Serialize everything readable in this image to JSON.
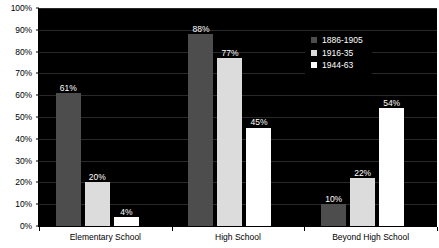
{
  "chart_data": {
    "type": "bar",
    "title": "",
    "xlabel": "",
    "ylabel": "",
    "categories": [
      "Elementary School",
      "High School",
      "Beyond High School"
    ],
    "series": [
      {
        "name": "1886-1905",
        "color": "#4d4d4d",
        "values": [
          61,
          88,
          10
        ],
        "labels": [
          "61%",
          "88%",
          "10%"
        ]
      },
      {
        "name": "1916-35",
        "color": "#dcdcdc",
        "values": [
          20,
          77,
          22
        ],
        "labels": [
          "20%",
          "77%",
          "22%"
        ]
      },
      {
        "name": "1944-63",
        "color": "#ffffff",
        "values": [
          4,
          45,
          54
        ],
        "labels": [
          "4%",
          "45%",
          "54%"
        ]
      }
    ],
    "ylim": [
      0,
      100
    ],
    "ytick_labels": [
      "100%",
      "90%",
      "80%",
      "70%",
      "60%",
      "50%",
      "40%",
      "30%",
      "20%",
      "10%",
      "0%"
    ],
    "ytick_values": [
      100,
      90,
      80,
      70,
      60,
      50,
      40,
      30,
      20,
      10,
      0
    ],
    "grid": true,
    "legend_position": "top-right",
    "plot_background": "#000000",
    "page_background": "#ffffff",
    "label_color": "#ffffff",
    "axis_text_color": "#000000"
  }
}
